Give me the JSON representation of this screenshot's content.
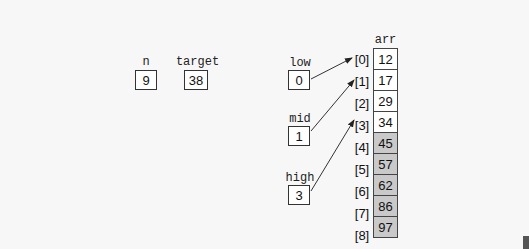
{
  "variables": {
    "n": {
      "label": "n",
      "value": "9"
    },
    "target": {
      "label": "target",
      "value": "38"
    },
    "low": {
      "label": "low",
      "value": "0",
      "points_to": 0
    },
    "mid": {
      "label": "mid",
      "value": "1",
      "points_to": 1
    },
    "high": {
      "label": "high",
      "value": "3",
      "points_to": 3
    }
  },
  "array": {
    "label": "arr",
    "indices": [
      "[0]",
      "[1]",
      "[2]",
      "[3]",
      "[4]",
      "[5]",
      "[6]",
      "[7]",
      "[8]"
    ],
    "values": [
      "12",
      "17",
      "29",
      "34",
      "45",
      "57",
      "62",
      "86",
      "97"
    ],
    "shaded_from_index": 4,
    "colors": {
      "active": "#ffffff",
      "eliminated": "#c9c9c9"
    }
  }
}
